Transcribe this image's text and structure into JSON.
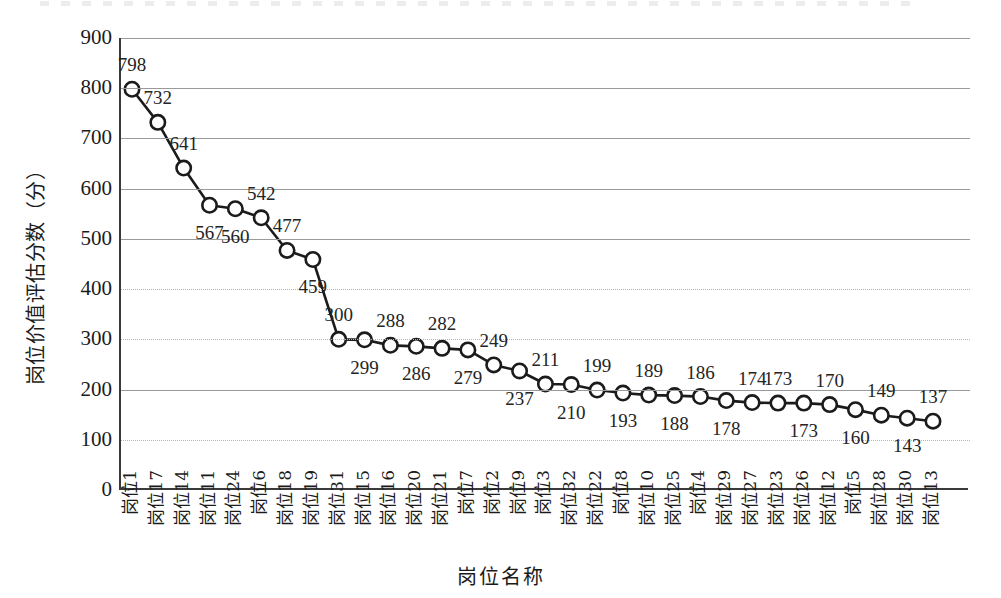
{
  "chart_data": {
    "type": "line",
    "title": "",
    "xlabel": "岗位名称",
    "ylabel": "岗位价值评估分数（分）",
    "ylim": [
      0,
      900
    ],
    "ytick_step": 100,
    "yticks": [
      "900",
      "800",
      "700",
      "600",
      "500",
      "400",
      "300",
      "200",
      "100",
      "0"
    ],
    "grid": true,
    "legend": "none",
    "marker": "open-circle",
    "line_color": "#1b1b1b",
    "marker_fill": "#ffffff",
    "categories": [
      "岗位1",
      "岗位17",
      "岗位14",
      "岗位11",
      "岗位24",
      "岗位6",
      "岗位18",
      "岗位19",
      "岗位31",
      "岗位15",
      "岗位16",
      "岗位20",
      "岗位21",
      "岗位7",
      "岗位2",
      "岗位9",
      "岗位3",
      "岗位32",
      "岗位22",
      "岗位8",
      "岗位10",
      "岗位25",
      "岗位4",
      "岗位29",
      "岗位27",
      "岗位23",
      "岗位26",
      "岗位12",
      "岗位5",
      "岗位28",
      "岗位30",
      "岗位13"
    ],
    "values": [
      798,
      732,
      641,
      567,
      560,
      542,
      477,
      459,
      300,
      299,
      288,
      286,
      282,
      279,
      249,
      237,
      211,
      210,
      199,
      193,
      189,
      188,
      186,
      178,
      174,
      173,
      173,
      170,
      160,
      149,
      143,
      137
    ],
    "label_positions": [
      "above",
      "above",
      "above",
      "below",
      "below",
      "above",
      "above",
      "below",
      "above",
      "below",
      "above",
      "below",
      "above",
      "below",
      "above",
      "below",
      "above",
      "below",
      "above",
      "below",
      "above",
      "below",
      "above",
      "below",
      "above",
      "above",
      "below",
      "above",
      "below",
      "above",
      "below",
      "above"
    ]
  }
}
